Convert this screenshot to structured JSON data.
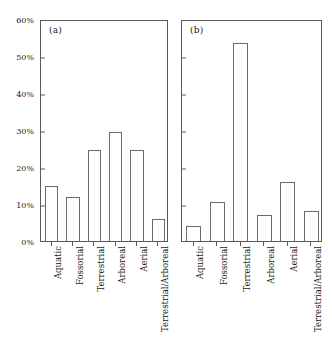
{
  "figure": {
    "background_color": "#ffffff",
    "axis_color": "#5a5a5a",
    "bar_edge_color": "#6b6b6b",
    "bar_fill_color": "#ffffff"
  },
  "panels": [
    {
      "letter": "(a)",
      "categories": [
        "Aquatic",
        "Fossorial",
        "Terrestrial",
        "Arboreal",
        "Aerial",
        "Terrestrial/Arboreal"
      ],
      "values": [
        15,
        12,
        24.5,
        29.5,
        24.5,
        6
      ]
    },
    {
      "letter": "(b)",
      "categories": [
        "Aquatic",
        "Fossorial",
        "Terrestrial",
        "Arboreal",
        "Aerial",
        "Terrestrial/Arboreal"
      ],
      "values": [
        4,
        10.5,
        53.5,
        7,
        16,
        8
      ]
    }
  ],
  "yaxis": {
    "ticks": [
      0,
      10,
      20,
      30,
      40,
      50,
      60
    ],
    "tick_labels": [
      "0%",
      "10%",
      "20%",
      "30%",
      "40%",
      "50%",
      "60%"
    ],
    "min": 0,
    "max": 60
  },
  "chart_data": {
    "type": "bar",
    "title": "",
    "xlabel": "",
    "ylabel": "",
    "ylim": [
      0,
      60
    ],
    "ytick_labels": [
      "0%",
      "10%",
      "20%",
      "30%",
      "40%",
      "50%",
      "60%"
    ],
    "yticks": [
      0,
      10,
      20,
      30,
      40,
      50,
      60
    ],
    "grid": false,
    "legend": null,
    "categories": [
      "Aquatic",
      "Fossorial",
      "Terrestrial",
      "Arboreal",
      "Aerial",
      "Terrestrial/Arboreal"
    ],
    "panels": [
      {
        "label": "(a)",
        "annotation": "(a)",
        "values": [
          15,
          12,
          24.5,
          29.5,
          24.5,
          6
        ],
        "units": "percent"
      },
      {
        "label": "(b)",
        "annotation": "(b)",
        "values": [
          4,
          10.5,
          53.5,
          7,
          16,
          8
        ],
        "units": "percent"
      }
    ]
  }
}
